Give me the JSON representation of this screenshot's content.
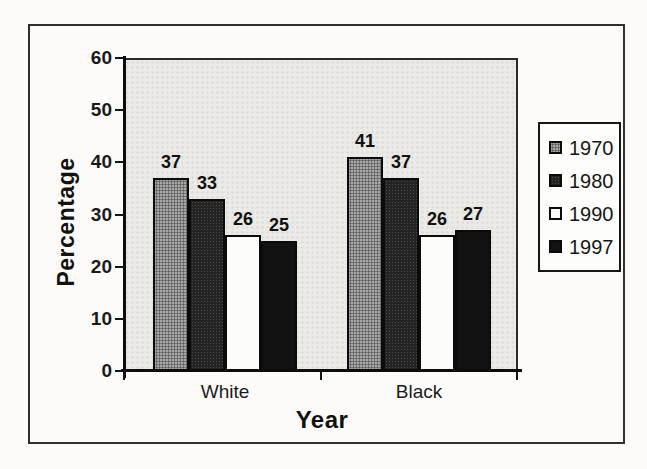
{
  "chart_data": {
    "type": "bar",
    "title": "",
    "categories": [
      "White",
      "Black"
    ],
    "series": [
      {
        "name": "1970",
        "values": [
          37,
          41
        ],
        "fill": "gray-halftone",
        "color": "#a6a6a6"
      },
      {
        "name": "1980",
        "values": [
          33,
          37
        ],
        "fill": "dark-speckle",
        "color": "#242424"
      },
      {
        "name": "1990",
        "values": [
          26,
          26
        ],
        "fill": "white",
        "color": "#fcfcfa"
      },
      {
        "name": "1997",
        "values": [
          25,
          27
        ],
        "fill": "black",
        "color": "#121212"
      }
    ],
    "xlabel": "Year",
    "ylabel": "Percentage",
    "ylim": [
      0,
      60
    ],
    "yticks": [
      0,
      10,
      20,
      30,
      40,
      50,
      60
    ],
    "grid": false,
    "legend_position": "right",
    "data_labels": true,
    "axis_color": "#0c0c0c",
    "plot_background": "#eceae6"
  }
}
